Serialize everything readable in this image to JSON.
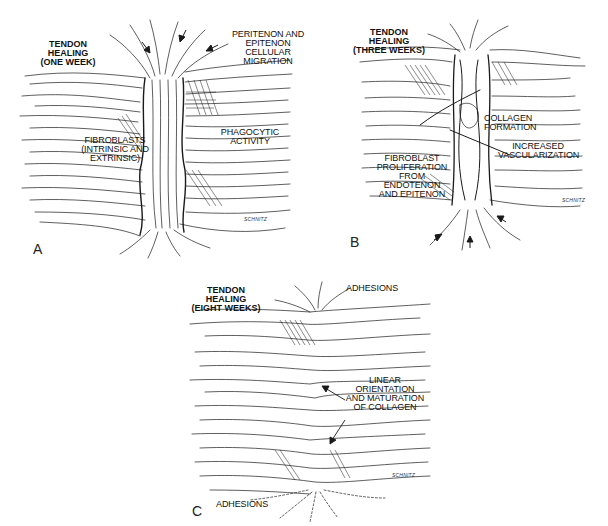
{
  "figure": {
    "panels": [
      {
        "letter": "A",
        "title": "TENDON HEALING\n(ONE WEEK)",
        "labels": [
          "PERITENON AND\nEPITENON CELLULAR\nMIGRATION",
          "PHAGOCYTIC ACTIVITY",
          "FIBROBLASTS\n(INTRINSIC AND\nEXTRINSIC)"
        ],
        "signature": "SCHNITZ"
      },
      {
        "letter": "B",
        "title": "TENDON HEALING\n(THREE WEEKS)",
        "labels": [
          "COLLAGEN FORMATION",
          "INCREASED\nVASCULARIZATION",
          "FIBROBLAST\nPROLIFERATION\nFROM ENDOTENON\nAND EPITENON"
        ],
        "signature": "SCHNITZ"
      },
      {
        "letter": "C",
        "title": "TENDON HEALING\n(EIGHT WEEKS)",
        "labels": [
          "ADHESIONS",
          "LINEAR ORIENTATION\nAND MATURATION\nOF COLLAGEN",
          "ADHESIONS"
        ],
        "signature": "SCHNITZ"
      }
    ],
    "colors": {
      "ink": "#1a1a1a",
      "background": "#ffffff"
    }
  }
}
